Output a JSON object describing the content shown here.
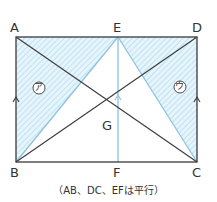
{
  "points": {
    "A": {
      "label": "A"
    },
    "B": {
      "label": "B"
    },
    "C": {
      "label": "C"
    },
    "D": {
      "label": "D"
    },
    "E": {
      "label": "E"
    },
    "F": {
      "label": "F"
    },
    "G": {
      "label": "G"
    }
  },
  "regions": {
    "left": {
      "label": "ア"
    },
    "right": {
      "label": "ウ"
    }
  },
  "caption": "（AB、DC、EFは平行）",
  "colors": {
    "line": "#3a3a3a",
    "blue_line": "#8cc4e0",
    "hatch": "#bfe0f0",
    "fill": "#e3f2fa"
  }
}
